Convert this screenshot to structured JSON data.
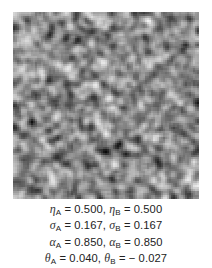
{
  "figure": {
    "image": {
      "type": "grayscale-random-texture",
      "description": "Synthetic mottled noise texture sample",
      "tone_min": "#0a0a0a",
      "tone_max": "#f2f2f2"
    },
    "caption_lines": [
      {
        "sym": "η",
        "a_sub": "A",
        "a_val": "0.500",
        "b_sub": "B",
        "b_val": "0.500"
      },
      {
        "sym": "σ",
        "a_sub": "A",
        "a_val": "0.167",
        "b_sub": "B",
        "b_val": "0.167"
      },
      {
        "sym": "α",
        "a_sub": "A",
        "a_val": "0.850",
        "b_sub": "B",
        "b_val": "0.850"
      },
      {
        "sym": "θ",
        "a_sub": "A",
        "a_val": "0.040",
        "b_sub": "B",
        "b_val": "− 0.027"
      }
    ],
    "equals": " = ",
    "separator": ", "
  }
}
